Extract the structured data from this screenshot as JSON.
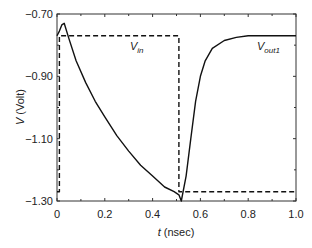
{
  "chart_data": {
    "type": "line",
    "title": "",
    "xlabel": "t (nsec)",
    "xlabel_var": "t",
    "xlabel_unit": "(nsec)",
    "ylabel": "V (Volt)",
    "ylabel_var": "V",
    "ylabel_unit": "(Volt)",
    "xlim": [
      0,
      1.0
    ],
    "ylim": [
      -1.3,
      -0.7
    ],
    "xticks": [
      "0",
      "0.2",
      "0.4",
      "0.6",
      "0.8",
      "1.0"
    ],
    "yticks": [
      "-0.70",
      "-0.90",
      "-1.10",
      "-1.30"
    ],
    "grid": false,
    "legend": "inline labels",
    "series": [
      {
        "name": "Vin",
        "label_main": "V",
        "label_sub": "in",
        "style": "dashed",
        "x": [
          0.0,
          0.01,
          0.01,
          0.51,
          0.51,
          1.0
        ],
        "y": [
          -1.27,
          -1.27,
          -0.77,
          -0.77,
          -1.27,
          -1.27
        ]
      },
      {
        "name": "Vout1",
        "label_main": "V",
        "label_sub": "out1",
        "style": "solid",
        "x": [
          0.0,
          0.01,
          0.02,
          0.03,
          0.05,
          0.08,
          0.12,
          0.16,
          0.2,
          0.25,
          0.3,
          0.35,
          0.4,
          0.45,
          0.49,
          0.51,
          0.52,
          0.54,
          0.56,
          0.58,
          0.6,
          0.62,
          0.65,
          0.7,
          0.75,
          0.8,
          0.9,
          1.0
        ],
        "y": [
          -0.77,
          -0.755,
          -0.735,
          -0.73,
          -0.78,
          -0.85,
          -0.92,
          -0.98,
          -1.03,
          -1.09,
          -1.14,
          -1.185,
          -1.22,
          -1.255,
          -1.27,
          -1.28,
          -1.3,
          -1.22,
          -1.1,
          -0.98,
          -0.9,
          -0.85,
          -0.81,
          -0.785,
          -0.775,
          -0.77,
          -0.77,
          -0.77
        ]
      }
    ]
  },
  "colors": {
    "axis": "#333333",
    "line": "#111111"
  }
}
